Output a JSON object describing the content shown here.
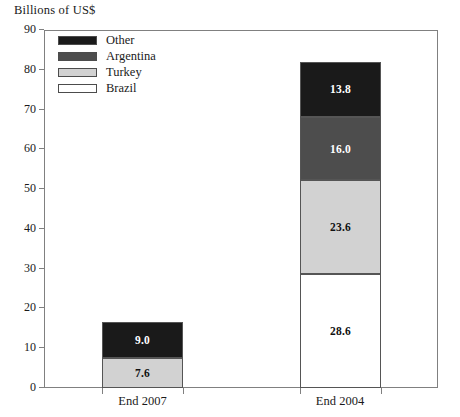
{
  "chart_data": {
    "type": "bar",
    "title": "Billions of US$",
    "subtitle": "",
    "xlabel": "",
    "ylabel": "Billions of US$",
    "ylim": [
      0,
      90
    ],
    "yticks": [
      0,
      10,
      20,
      30,
      40,
      50,
      60,
      70,
      80,
      90
    ],
    "grid": false,
    "stacked": true,
    "legend_position": "top-left-inside",
    "categories": [
      "End 2007",
      "End 2004"
    ],
    "series": [
      {
        "name": "Brazil",
        "color": "#ffffff",
        "values": [
          0.0,
          28.6
        ],
        "labels": [
          "",
          "28.6"
        ]
      },
      {
        "name": "Turkey",
        "color": "#d2d2d2",
        "values": [
          7.6,
          23.6
        ],
        "labels": [
          "7.6",
          "23.6"
        ]
      },
      {
        "name": "Argentina",
        "color": "#4d4d4d",
        "values": [
          0.0,
          16.0
        ],
        "labels": [
          "",
          "16.0"
        ]
      },
      {
        "name": "Other",
        "color": "#1a1a1a",
        "values": [
          9.0,
          13.8
        ],
        "labels": [
          "9.0",
          "13.8"
        ]
      }
    ],
    "totals": [
      16.6,
      82.0
    ],
    "legend_order": [
      "Other",
      "Argentina",
      "Turkey",
      "Brazil"
    ]
  },
  "axis": {
    "y_tick_labels": [
      "90",
      "80",
      "70",
      "60",
      "50",
      "40",
      "30",
      "20",
      "10",
      "0"
    ],
    "x_tick_labels": [
      "End 2007",
      "End 2004"
    ]
  },
  "legend": {
    "items": [
      {
        "label": "Other",
        "color": "#1a1a1a"
      },
      {
        "label": "Argentina",
        "color": "#4d4d4d"
      },
      {
        "label": "Turkey",
        "color": "#d2d2d2"
      },
      {
        "label": "Brazil",
        "color": "#ffffff"
      }
    ]
  },
  "colors": {
    "other": "#1a1a1a",
    "argentina": "#4d4d4d",
    "turkey": "#d2d2d2",
    "brazil": "#ffffff",
    "axis": "#808080",
    "segment_border": "#555555",
    "text": "#1a1a1a"
  }
}
